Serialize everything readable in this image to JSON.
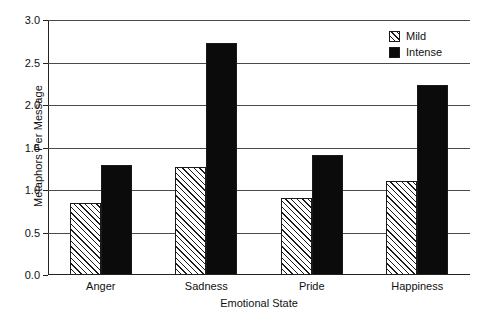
{
  "chart_data": {
    "type": "bar",
    "title": "",
    "xlabel": "Emotional State",
    "ylabel": "Metaphors Per Message",
    "categories": [
      "Anger",
      "Sadness",
      "Pride",
      "Happiness"
    ],
    "series": [
      {
        "name": "Mild",
        "values": [
          0.85,
          1.27,
          0.91,
          1.11
        ],
        "fill": "diagonal-hatch"
      },
      {
        "name": "Intense",
        "values": [
          1.3,
          2.73,
          1.41,
          2.23
        ],
        "fill": "solid-black"
      }
    ],
    "ylim": [
      0.0,
      3.0
    ],
    "yticks": [
      "0.0",
      "0.5",
      "1.0",
      "1.5",
      "2.0",
      "2.5",
      "3.0"
    ],
    "ytick_values": [
      0.0,
      0.5,
      1.0,
      1.5,
      2.0,
      2.5,
      3.0
    ],
    "grid": true,
    "legend_position": "top-right",
    "colors": {
      "bar_intense": "#0b0b0b",
      "bar_mild": "#ffffff",
      "hatch": "#1a1a1a",
      "axis": "#222222",
      "gridline": "#4a4a4a",
      "background": "#ffffff"
    }
  },
  "legend": {
    "items": [
      {
        "label": "Mild",
        "swatch": "hatched-square-icon"
      },
      {
        "label": "Intense",
        "swatch": "filled-square-icon"
      }
    ]
  }
}
